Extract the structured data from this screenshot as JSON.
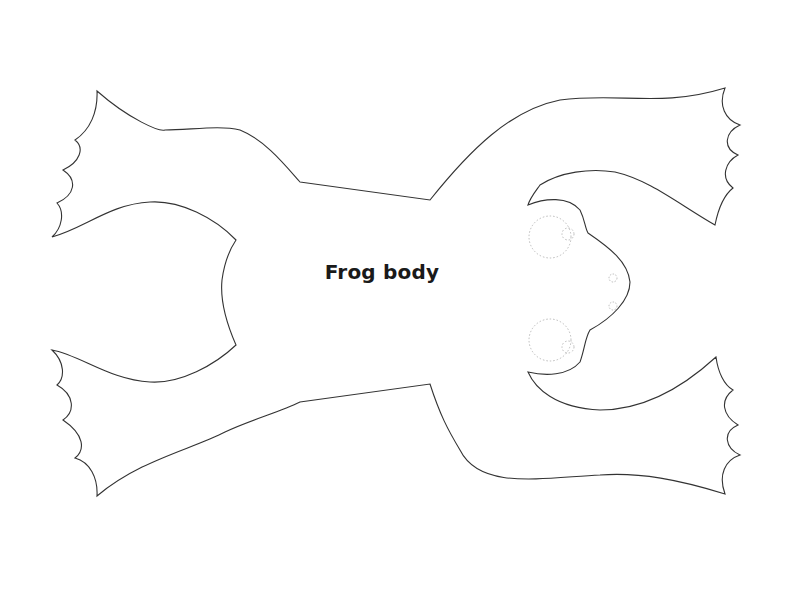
{
  "diagram": {
    "title": "Frog body",
    "outline_color": "#333333",
    "guide_color": "#bbbbbb",
    "background": "#ffffff",
    "parts": [
      "body",
      "front-left-leg",
      "front-right-leg",
      "back-left-leg",
      "back-right-leg",
      "head",
      "left-eye-guide",
      "right-eye-guide",
      "nostril-guides"
    ]
  }
}
